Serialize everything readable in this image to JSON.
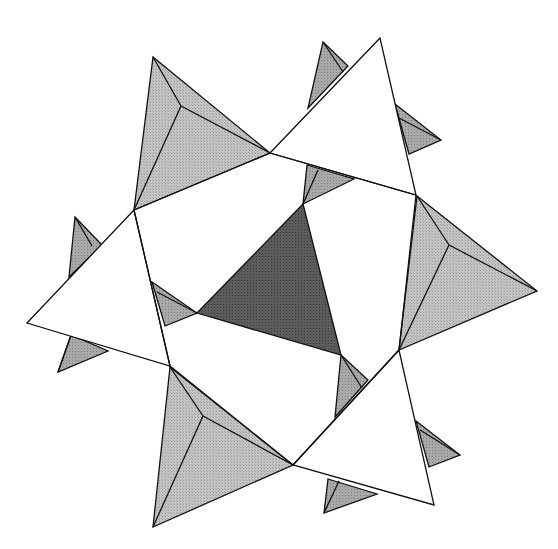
{
  "diagram": {
    "colors": {
      "background": "#ffffff",
      "white_face": "#ffffff",
      "light_gray_face": "#bdbdbd",
      "mid_gray_face": "#a6a6a6",
      "dark_face": "#5a5a5a",
      "edge": "#111111"
    },
    "central_face": {
      "points": "303,204 197,313 341,355"
    },
    "small_tetrahedra": [
      {
        "name": "small-tetra-top",
        "outer": "323,42 348,66 308,108",
        "edge": "323,42 343,72"
      },
      {
        "name": "small-tetra-top-right",
        "outer": "395,104 441,140 409,154",
        "edge": "399,118 441,140"
      },
      {
        "name": "small-tetra-center-top",
        "outer": "307,165 354,179 303,204",
        "edge": "318,170 303,204"
      },
      {
        "name": "small-tetra-left-upper",
        "outer": "75,217 102,245 69,277",
        "edge": "75,217 92,246"
      },
      {
        "name": "small-tetra-center-left",
        "outer": "152,282 197,313 165,326",
        "edge": "157,292 197,313"
      },
      {
        "name": "small-tetra-left-lower",
        "outer": "71,335 108,351 58,372",
        "edge": "71,335 58,372"
      },
      {
        "name": "small-tetra-center-bottom",
        "outer": "341,355 368,380 335,417",
        "edge": "341,355 362,388"
      },
      {
        "name": "small-tetra-right-lower",
        "outer": "416,421 460,455 429,467",
        "edge": "420,430 460,455"
      },
      {
        "name": "small-tetra-bottom",
        "outer": "328,479 377,494 324,513",
        "edge": "339,481 324,513"
      }
    ],
    "large_tetrahedra": [
      {
        "name": "tetra-top-left",
        "apex": "153,57",
        "inner": "181,106",
        "corners": "153,57 270,153 134,210"
      },
      {
        "name": "tetra-right",
        "apex": "537,291",
        "inner": "449,245",
        "corners": "417,196 537,291 399,350"
      },
      {
        "name": "tetra-bottom-left",
        "apex": "153,527",
        "inner": "203,416",
        "corners": "170,367 293,465 153,527"
      }
    ],
    "white_triangles": [
      {
        "name": "white-triangle-top",
        "points": "380,38 270,153 416,195"
      },
      {
        "name": "white-triangle-left",
        "points": "134,210 27,323 170,366"
      },
      {
        "name": "white-triangle-bottom-right",
        "points": "399,350 293,465 434,505"
      }
    ],
    "ring_edges": [
      "270,153 134,210",
      "134,210 170,366",
      "416,195 399,350",
      "270,153 416,195",
      "170,366 293,465",
      "399,350 293,465"
    ]
  }
}
